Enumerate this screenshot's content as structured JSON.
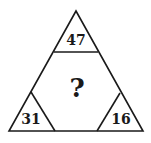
{
  "puzzle": {
    "top": "47",
    "bottom_left": "31",
    "bottom_right": "16",
    "center": "?"
  },
  "colors": {
    "stroke": "#1a1a1a",
    "background": "#ffffff"
  }
}
